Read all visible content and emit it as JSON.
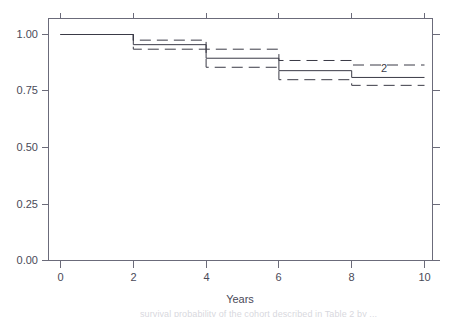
{
  "figure": {
    "background_color": "#ffffff",
    "axis_color": "#6b6b7a",
    "curve_color": "#3a3a46",
    "partial_caption": "survival probability of the cohort described in Table 2 by ..."
  },
  "axes": {
    "x_title": "Years",
    "y_title": "",
    "x_ticks": [
      "0",
      "2",
      "4",
      "6",
      "8",
      "10"
    ],
    "y_ticks": [
      "0.00",
      "0.25",
      "0.50",
      "0.75",
      "1.00"
    ]
  },
  "annotations": [
    {
      "text": "2",
      "x": 9.3,
      "y": 0.845
    }
  ],
  "chart_data": {
    "type": "line",
    "title": "",
    "xlabel": "Years",
    "ylabel": "",
    "xlim": [
      -0.3,
      10.3
    ],
    "ylim": [
      -0.04,
      1.06
    ],
    "xticks": [
      0,
      2,
      4,
      6,
      8,
      10
    ],
    "yticks": [
      0.0,
      0.25,
      0.5,
      0.75,
      1.0
    ],
    "grid": false,
    "legend": null,
    "step_type": "post",
    "annotations": [
      {
        "text": "2",
        "x": 9.3,
        "y": 0.845
      }
    ],
    "x": [
      0,
      2,
      4,
      6,
      8,
      10
    ],
    "series": [
      {
        "name": "Survival estimate",
        "style": "solid",
        "values": [
          1.0,
          0.955,
          0.895,
          0.84,
          0.81,
          0.81
        ]
      },
      {
        "name": "Upper 95% confidence limit",
        "style": "dashed",
        "values": [
          1.0,
          0.975,
          0.935,
          0.885,
          0.865,
          0.865
        ]
      },
      {
        "name": "Lower 95% confidence limit",
        "style": "dashed",
        "values": [
          1.0,
          0.935,
          0.855,
          0.8,
          0.775,
          0.775
        ]
      }
    ]
  }
}
